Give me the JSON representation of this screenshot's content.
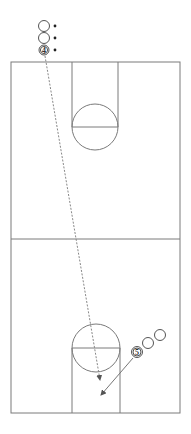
{
  "diagram": {
    "type": "basketball-half-court-drill",
    "colors": {
      "court_line": "#7a7a7a",
      "player_stroke": "#555555",
      "path": "#888888",
      "arrow": "#777777",
      "background": "#ffffff"
    },
    "court": {
      "left": 11,
      "top": 62,
      "right": 180,
      "bottom": 413,
      "midline_y": 239,
      "top_lane": {
        "x1": 72,
        "x2": 118,
        "free_throw_y": 127,
        "circle_r": 23
      },
      "bottom_lane": {
        "x1": 72,
        "x2": 120,
        "free_throw_y": 348,
        "circle_r": 24
      }
    },
    "players": [
      {
        "id": "top-1",
        "label": "",
        "cx": 44,
        "cy": 26,
        "ball": true
      },
      {
        "id": "top-2",
        "label": "",
        "cx": 44,
        "cy": 38,
        "ball": true
      },
      {
        "id": "player-4",
        "label": "4",
        "cx": 44,
        "cy": 50,
        "ball": true
      },
      {
        "id": "player-5",
        "label": "5",
        "cx": 137,
        "cy": 352,
        "ball": false
      },
      {
        "id": "right-1",
        "label": "",
        "cx": 148,
        "cy": 343,
        "ball": false
      },
      {
        "id": "right-2",
        "label": "",
        "cx": 160,
        "cy": 335,
        "ball": false
      }
    ],
    "paths": [
      {
        "id": "dribble-path",
        "style": "dashed",
        "from": [
          45,
          56
        ],
        "to": [
          100,
          380
        ]
      },
      {
        "id": "cut-path",
        "style": "solid",
        "from": [
          133,
          358
        ],
        "to": [
          101,
          395
        ]
      }
    ]
  }
}
